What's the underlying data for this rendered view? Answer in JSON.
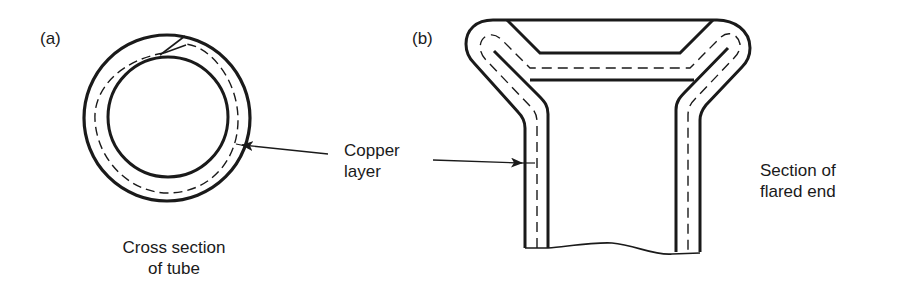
{
  "panels": [
    {
      "id": "a",
      "label": "(a)",
      "caption_line1": "Cross section",
      "caption_line2": "of tube"
    },
    {
      "id": "b",
      "label": "(b)",
      "caption_line1": "Section of",
      "caption_line2": "flared end"
    }
  ],
  "callout": {
    "line1": "Copper",
    "line2": "layer"
  },
  "colors": {
    "ink": "#1a1a1a",
    "background": "#ffffff"
  }
}
